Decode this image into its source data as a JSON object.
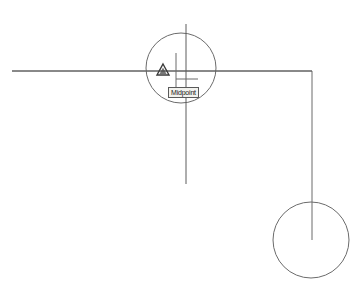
{
  "app": {
    "name": "CAD Drawing Area",
    "background_color": "#ffffff",
    "geometry_color": "#6b6b6b",
    "cursor_color": "#5c5c5c",
    "marker_color": "#3a3a3a"
  },
  "snap": {
    "tooltip_label": "Midpoint",
    "marker_type": "triangle",
    "marker_name": "midpoint-marker",
    "tooltip_border_color": "#5a5a5a",
    "tooltip_background": "#f2f2ee",
    "tooltip_text_color": "#1a1a1a"
  },
  "cursor": {
    "crosshair_x": 186,
    "crosshair_y": 71,
    "aperture_radius": 35
  },
  "drawing": {
    "polyline_points": "12,71 312,71 312,240",
    "circle_large": {
      "cx": 311,
      "cy": 240,
      "r": 38
    },
    "pick_line_x": 176,
    "pick_line_top": 53,
    "pick_line_bottom": 98,
    "pick_arm_y": 79,
    "pick_arm_x1": 176,
    "pick_arm_x2": 198
  }
}
